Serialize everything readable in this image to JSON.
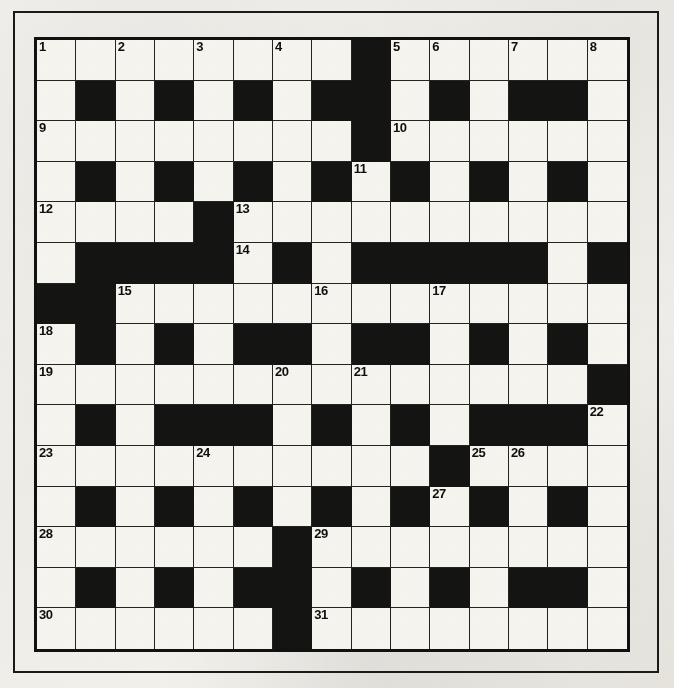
{
  "puzzle": {
    "kind": "crossword-grid",
    "rows": 15,
    "columns": 15,
    "colors": {
      "paper": "#f2f1ec",
      "cell_white": "#f7f6f1",
      "cell_black": "#141412",
      "grid_line": "#23231f",
      "frame": "#1a1a18",
      "number_text": "#100f0d"
    },
    "numbers_visible": [
      "1",
      "2",
      "3",
      "4",
      "5",
      "6",
      "7",
      "8",
      "9",
      "10",
      "11",
      "12",
      "13",
      "14",
      "15",
      "16",
      "17",
      "18",
      "19",
      "20",
      "21",
      "22",
      "23",
      "24",
      "25",
      "26",
      "27",
      "28",
      "29",
      "30",
      "31"
    ],
    "highest_number": 31,
    "grid": [
      [
        "W1",
        "W",
        "W2",
        "W",
        "W3",
        "W",
        "W4",
        "W",
        "B",
        "W5",
        "W6",
        "W",
        "W7",
        "W",
        "W8"
      ],
      [
        "W",
        "B",
        "W",
        "B",
        "W",
        "B",
        "W",
        "B",
        "B",
        "W",
        "B",
        "W",
        "B",
        "B",
        "W"
      ],
      [
        "W9",
        "W",
        "W",
        "W",
        "W",
        "W",
        "W",
        "W",
        "B",
        "W10",
        "W",
        "W",
        "W",
        "W",
        "W"
      ],
      [
        "W",
        "B",
        "W",
        "B",
        "W",
        "B",
        "W",
        "B",
        "W11",
        "B",
        "W",
        "B",
        "W",
        "B",
        "W"
      ],
      [
        "W12",
        "W",
        "W",
        "W",
        "B",
        "W13",
        "W",
        "W",
        "W",
        "W",
        "W",
        "W",
        "W",
        "W",
        "W"
      ],
      [
        "W",
        "B",
        "B",
        "B",
        "B",
        "W14",
        "B",
        "W",
        "B",
        "B",
        "B",
        "B",
        "B",
        "W",
        "B"
      ],
      [
        "B",
        "B",
        "W15",
        "W",
        "W",
        "W",
        "W",
        "W16",
        "W",
        "W",
        "W17",
        "W",
        "W",
        "W",
        "W"
      ],
      [
        "W18",
        "B",
        "W",
        "B",
        "W",
        "B",
        "B",
        "W",
        "B",
        "B",
        "W",
        "B",
        "W",
        "B",
        "W"
      ],
      [
        "W19",
        "W",
        "W",
        "W",
        "W",
        "W",
        "W20",
        "W",
        "W21",
        "W",
        "W",
        "W",
        "W",
        "W",
        "B"
      ],
      [
        "W",
        "B",
        "W",
        "B",
        "B",
        "B",
        "W",
        "B",
        "W",
        "B",
        "W",
        "B",
        "B",
        "B",
        "W22"
      ],
      [
        "W23",
        "W",
        "W",
        "W",
        "W24",
        "W",
        "W",
        "W",
        "W",
        "W",
        "B",
        "W25",
        "W26",
        "W",
        "W"
      ],
      [
        "W",
        "B",
        "W",
        "B",
        "W",
        "B",
        "W",
        "B",
        "W",
        "B",
        "W27",
        "B",
        "W",
        "B",
        "W"
      ],
      [
        "W28",
        "W",
        "W",
        "W",
        "W",
        "W",
        "B",
        "W29",
        "W",
        "W",
        "W",
        "W",
        "W",
        "W",
        "W"
      ],
      [
        "W",
        "B",
        "W",
        "B",
        "W",
        "B",
        "B",
        "W",
        "B",
        "W",
        "B",
        "W",
        "B",
        "B",
        "W"
      ],
      [
        "W30",
        "W",
        "W",
        "W",
        "W",
        "W",
        "B",
        "W31",
        "W",
        "W",
        "W",
        "W",
        "W",
        "W",
        "W"
      ]
    ]
  }
}
